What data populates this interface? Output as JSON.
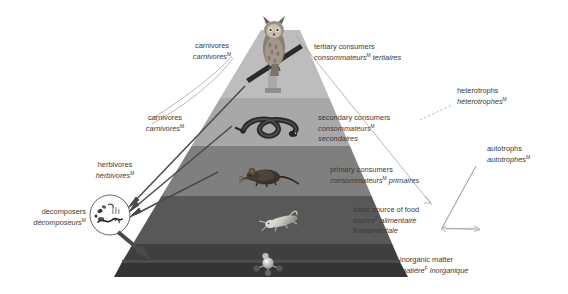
{
  "figure": {
    "bg_color": "#ffffff",
    "text_color": "#3a3a3a",
    "marker": "M"
  },
  "pyramid": {
    "levels": [
      {
        "name": "tertiary-consumers",
        "band_color": "#b9b9b9",
        "organism": "owl"
      },
      {
        "name": "secondary-consumers",
        "band_color": "#a7a7a7",
        "organism": "snake"
      },
      {
        "name": "primary-consumers",
        "band_color": "#808080",
        "organism": "mouse"
      },
      {
        "name": "basic-source-of-food",
        "band_color": "#595959",
        "organism": "grasshopper"
      },
      {
        "name": "inorganic-matter",
        "band_color": "#3d3d3d",
        "organism": "molecule"
      }
    ],
    "base_top_color": "#4a4a4a"
  },
  "right_labels": [
    {
      "en": "tertiary consumers",
      "fr": "consommateurs",
      "fr2": " tertiaires",
      "marker": "M"
    },
    {
      "en": "secondary consumers",
      "fr": "consommateurs",
      "fr2": "",
      "fr3": "secondaires",
      "marker": "M"
    },
    {
      "en": "primary consumers",
      "fr": "consommateurs",
      "fr2": " primaires",
      "marker": "M"
    },
    {
      "en": "basic source of food",
      "fr": "source",
      "fr2": " alimentaire",
      "fr3": "fondamentale",
      "marker": "F"
    },
    {
      "en": "inorganic matter",
      "fr": "matière",
      "fr2": " inorganique",
      "marker": "F"
    }
  ],
  "left_labels": [
    {
      "en": "carnivores",
      "fr": "carnivores",
      "marker": "M"
    },
    {
      "en": "carnivores",
      "fr": "carnivores",
      "marker": "M"
    },
    {
      "en": "herbivores",
      "fr": "herbivores",
      "marker": "M"
    },
    {
      "en": "decomposers",
      "fr": "décomposeurs",
      "marker": "M"
    }
  ],
  "bracket_labels": [
    {
      "en": "heterotrophs",
      "fr": "hétérotrophes",
      "marker": "M"
    },
    {
      "en": "autotrophs",
      "fr": "autotrophes",
      "marker": "M"
    }
  ],
  "text": {
    "tertiary_en": "tertiary consumers",
    "tertiary_fr_a": "consommateurs",
    "tertiary_fr_b": " tertiaires",
    "secondary_en": "secondary consumers",
    "secondary_fr_a": "consommateurs",
    "secondary_fr_b": "secondaires",
    "primary_en": "primary consumers",
    "primary_fr_a": "consommateurs",
    "primary_fr_b": " primaires",
    "basic_en": "basic source of food",
    "basic_fr_a": "source",
    "basic_fr_b": " alimentaire",
    "basic_fr_c": "fondamentale",
    "inorganic_en": "inorganic matter",
    "inorganic_fr_a": "matière",
    "inorganic_fr_b": " inorganique",
    "carn1_en": "carnivores",
    "carn1_fr": "carnivores",
    "carn2_en": "carnivores",
    "carn2_fr": "carnivores",
    "herb_en": "herbivores",
    "herb_fr": "herbivores",
    "dec_en": "decomposers",
    "dec_fr": "décomposeurs",
    "het_en": "heterotrophs",
    "het_fr": "hétérotrophes",
    "auto_en": "autotrophs",
    "auto_fr": "autotrophes",
    "marker_m": "M",
    "marker_f": "F"
  }
}
